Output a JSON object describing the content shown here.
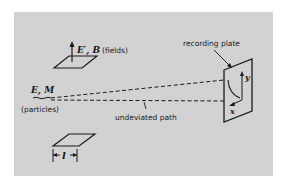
{
  "diagram": {
    "background_color": "#d2d2d2",
    "line_color": "#1a1a1a",
    "labels": {
      "fields_symbol": "E′, B",
      "fields_text": "(fields)",
      "particles_symbol": "E, M",
      "particles_text": "(particles)",
      "recording_plate": "recording plate",
      "undeviated_path": "undeviated path",
      "axis_y": "y",
      "axis_x": "x",
      "length": "l"
    }
  }
}
